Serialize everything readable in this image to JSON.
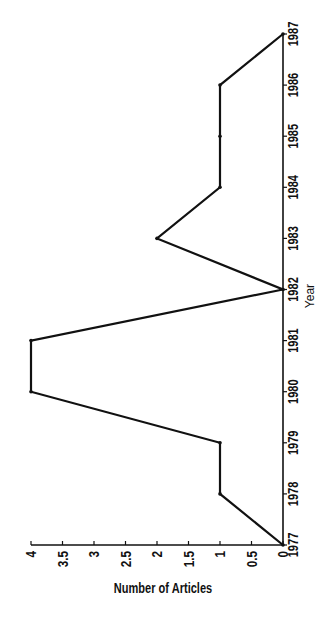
{
  "chart_data": {
    "type": "line",
    "orientation": "rotated-90-ccw",
    "title": "",
    "xlabel": "Year",
    "ylabel": "Number of Articles",
    "categories": [
      "1977",
      "1978",
      "1979",
      "1980",
      "1981",
      "1982",
      "1983",
      "1984",
      "1985",
      "1986",
      "1987"
    ],
    "series": [
      {
        "name": "Number of Articles",
        "values": [
          0,
          1,
          1,
          4,
          4,
          0,
          2,
          1,
          1,
          1,
          0
        ]
      }
    ],
    "y_ticks": [
      "0",
      "0.5",
      "1",
      "1.5",
      "2",
      "2.5",
      "3",
      "3.5",
      "4"
    ],
    "ylim": [
      0,
      4
    ],
    "grid": false,
    "legend": null,
    "line_color": "#111111"
  }
}
